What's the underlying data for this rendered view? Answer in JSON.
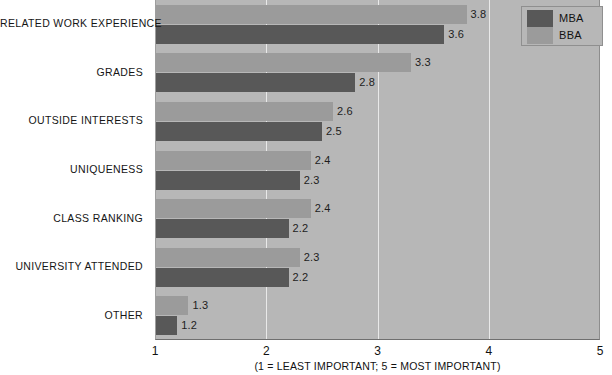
{
  "chart_data": {
    "type": "bar",
    "orientation": "horizontal",
    "title": "",
    "subtitle": "",
    "xlabel": "(1 = LEAST IMPORTANT; 5 = MOST IMPORTANT)",
    "ylabel": "",
    "xlim": [
      1,
      5
    ],
    "xticks": [
      "1",
      "2",
      "3",
      "4",
      "5"
    ],
    "grid": true,
    "legend_position": "top-right",
    "categories": [
      "RELATED WORK EXPERIENCE",
      "GRADES",
      "OUTSIDE INTERESTS",
      "UNIQUENESS",
      "CLASS RANKING",
      "UNIVERSITY ATTENDED",
      "OTHER"
    ],
    "series": [
      {
        "name": "BBA",
        "color": "#9b9b9b",
        "values": [
          3.8,
          3.3,
          2.6,
          2.4,
          2.4,
          2.3,
          1.3
        ],
        "labels": [
          "3.8",
          "3.3",
          "2.6",
          "2.4",
          "2.4",
          "2.3",
          "1.3"
        ]
      },
      {
        "name": "MBA",
        "color": "#585858",
        "values": [
          3.6,
          2.8,
          2.5,
          2.3,
          2.2,
          2.2,
          1.2
        ],
        "labels": [
          "3.6",
          "2.8",
          "2.5",
          "2.3",
          "2.2",
          "2.2",
          "1.2"
        ]
      }
    ]
  },
  "legend": {
    "items": [
      {
        "label": "MBA",
        "color": "#585858"
      },
      {
        "label": "BBA",
        "color": "#9b9b9b"
      }
    ]
  },
  "colors": {
    "plot_background": "#b7b7b7",
    "gridline": "#e9e9e9",
    "page_background": "#ffffff",
    "text": "#151515"
  }
}
